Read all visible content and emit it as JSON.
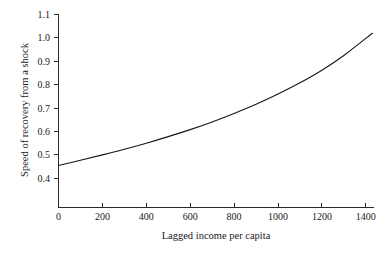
{
  "chart_data": {
    "type": "line",
    "title": "",
    "xlabel": "Lagged income per capita",
    "ylabel": "Speed of recovery from a shock",
    "xlim": [
      0,
      1430
    ],
    "ylim": [
      0.33,
      1.1
    ],
    "grid": false,
    "legend": null,
    "xticks": [
      0,
      200,
      400,
      600,
      800,
      1000,
      1200,
      1400
    ],
    "xticklabels": [
      "0",
      "200",
      "400",
      "600",
      "800",
      "1000",
      "1200",
      "1400"
    ],
    "yticks": [
      0.4,
      0.5,
      0.6,
      0.7,
      0.8,
      0.9,
      1.0,
      1.1
    ],
    "yticklabels": [
      "0.4",
      "0.5",
      "0.6",
      "0.7",
      "0.8",
      "0.9",
      "1.0",
      "1.1"
    ],
    "series": [
      {
        "name": "Speed of recovery",
        "color": "#161616",
        "x": [
          0,
          100,
          200,
          300,
          400,
          500,
          600,
          700,
          800,
          900,
          1000,
          1100,
          1200,
          1300,
          1430
        ],
        "values": [
          0.455,
          0.477,
          0.5,
          0.524,
          0.55,
          0.578,
          0.608,
          0.641,
          0.677,
          0.716,
          0.76,
          0.808,
          0.862,
          0.925,
          1.02
        ]
      }
    ]
  },
  "axes": {
    "x_title": "Lagged income per capita",
    "y_title": "Speed of recovery from a shock"
  },
  "ticks": {
    "x": [
      "0",
      "200",
      "400",
      "600",
      "800",
      "1000",
      "1200",
      "1400"
    ],
    "y": [
      "1.1",
      "1.0",
      "0.9",
      "0.8",
      "0.7",
      "0.6",
      "0.5",
      "0.4"
    ]
  }
}
